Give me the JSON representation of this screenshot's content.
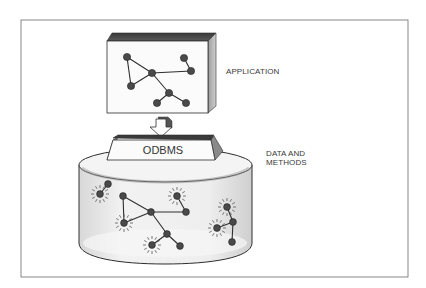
{
  "diagram": {
    "type": "architecture-illustration",
    "style": "pencil-sketch",
    "components": [
      {
        "id": "application",
        "label": "APPLICATION",
        "shape": "3d-box",
        "content": "object-graph"
      },
      {
        "id": "odbms",
        "label": "ODBMS",
        "shape": "beveled-plate"
      },
      {
        "id": "database",
        "label": "DATA AND\nMETHODS",
        "shape": "cylinder",
        "content": "object-graph-with-active-methods"
      }
    ],
    "connections": [
      {
        "from": "application",
        "to": "odbms",
        "kind": "arrow-down"
      },
      {
        "from": "odbms",
        "to": "database",
        "kind": "sits-on-top"
      }
    ]
  },
  "labels": {
    "application": "APPLICATION",
    "odbms": "ODBMS",
    "data_line1": "DATA AND",
    "data_line2": "METHODS"
  },
  "colors": {
    "ink": "#2e2e2e",
    "node": "#4a4a4a",
    "shade": "#bdbdbd",
    "background": "#ffffff"
  }
}
